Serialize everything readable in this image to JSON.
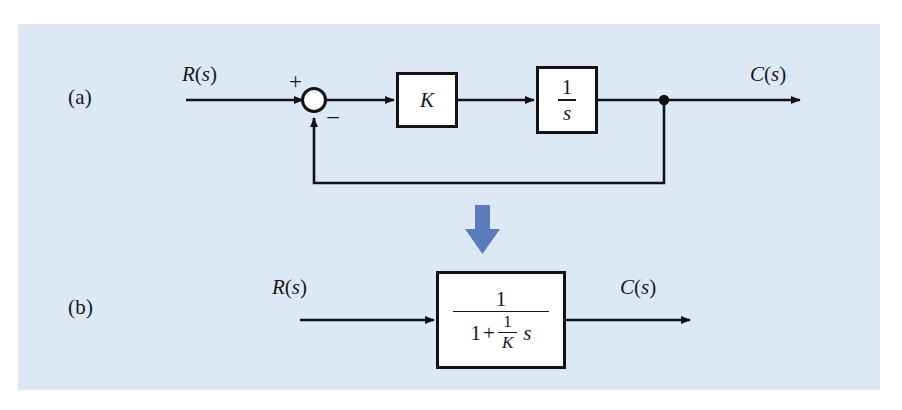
{
  "figure": {
    "background_color": "#dce9f4",
    "page_color": "#ffffff",
    "line_color": "#111316",
    "transition_arrow_color": "#5b7bba",
    "parts": [
      {
        "key": "a",
        "label": "(a)"
      },
      {
        "key": "b",
        "label": "(b)"
      }
    ]
  },
  "diagram_a": {
    "caption": "(a)",
    "input_label": {
      "base": "R",
      "open": "(",
      "arg": "s",
      "close": ")"
    },
    "output_label": {
      "base": "C",
      "open": "(",
      "arg": "s",
      "close": ")"
    },
    "summing_junction": {
      "name": "summing-junction",
      "positive_sign": "+",
      "negative_sign": "−"
    },
    "blocks": [
      {
        "name": "gain-block",
        "value": "K"
      },
      {
        "name": "integrator-block",
        "numerator": "1",
        "denominator": "s"
      }
    ],
    "feedback": {
      "type": "unity",
      "label": ""
    }
  },
  "diagram_b": {
    "caption": "(b)",
    "input_label": {
      "base": "R",
      "open": "(",
      "arg": "s",
      "close": ")"
    },
    "output_label": {
      "base": "C",
      "open": "(",
      "arg": "s",
      "close": ")"
    },
    "closed_loop_block": {
      "name": "closed-loop-transfer-function",
      "numerator": "1",
      "denominator": {
        "leading_term": "1",
        "operator": "+",
        "fraction_numerator": "1",
        "fraction_denominator": "K",
        "variable": "s"
      }
    }
  },
  "transition": {
    "name": "downward-transition-arrow",
    "direction": "down",
    "color": "#5b7bba"
  }
}
